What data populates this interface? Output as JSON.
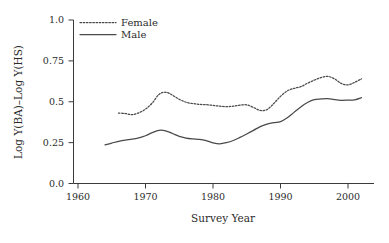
{
  "chart_data": {
    "type": "line",
    "title": "",
    "subtitle": "",
    "xlabel": "Survey Year",
    "ylabel": "Log Y(BA)–Log Y(HS)",
    "xlim": [
      1958,
      2004
    ],
    "ylim": [
      0.0,
      1.0
    ],
    "grid": false,
    "legend_position": "top-left",
    "xticks": [
      1960,
      1970,
      1980,
      1990,
      2000
    ],
    "xtick_labels": [
      "1960",
      "1970",
      "1980",
      "1990",
      "2000"
    ],
    "yticks": [
      0.0,
      0.25,
      0.5,
      0.75,
      1.0
    ],
    "ytick_labels": [
      "0.0",
      "0.25",
      "0.5",
      "0.75",
      "1.0"
    ],
    "series": [
      {
        "name": "Female",
        "style": "dotted",
        "color": "#4a4a4a",
        "x": [
          1966,
          1967,
          1968,
          1969,
          1970,
          1971,
          1972,
          1973,
          1974,
          1975,
          1976,
          1977,
          1978,
          1979,
          1980,
          1981,
          1982,
          1983,
          1984,
          1985,
          1986,
          1987,
          1988,
          1989,
          1990,
          1991,
          1992,
          1993,
          1994,
          1995,
          1996,
          1997,
          1998,
          1999,
          2000,
          2001,
          2002
        ],
        "y": [
          0.431,
          0.428,
          0.421,
          0.432,
          0.455,
          0.492,
          0.545,
          0.558,
          0.54,
          0.515,
          0.497,
          0.489,
          0.484,
          0.482,
          0.478,
          0.473,
          0.47,
          0.473,
          0.479,
          0.481,
          0.465,
          0.447,
          0.452,
          0.489,
          0.533,
          0.566,
          0.582,
          0.592,
          0.613,
          0.632,
          0.648,
          0.655,
          0.64,
          0.612,
          0.603,
          0.619,
          0.64
        ]
      },
      {
        "name": "Male",
        "style": "solid",
        "color": "#4a4a4a",
        "x": [
          1964,
          1965,
          1966,
          1967,
          1968,
          1969,
          1970,
          1971,
          1972,
          1973,
          1974,
          1975,
          1976,
          1977,
          1978,
          1979,
          1980,
          1981,
          1982,
          1983,
          1984,
          1985,
          1986,
          1987,
          1988,
          1989,
          1990,
          1991,
          1992,
          1993,
          1994,
          1995,
          1996,
          1997,
          1998,
          1999,
          2000,
          2001,
          2002
        ],
        "y": [
          0.236,
          0.247,
          0.258,
          0.266,
          0.271,
          0.279,
          0.292,
          0.311,
          0.325,
          0.322,
          0.306,
          0.288,
          0.278,
          0.273,
          0.27,
          0.262,
          0.249,
          0.243,
          0.25,
          0.263,
          0.282,
          0.303,
          0.325,
          0.348,
          0.363,
          0.372,
          0.378,
          0.402,
          0.435,
          0.468,
          0.495,
          0.513,
          0.517,
          0.519,
          0.513,
          0.509,
          0.51,
          0.512,
          0.525
        ]
      }
    ],
    "annotations": []
  },
  "legend": {
    "items": [
      {
        "label": "Female",
        "style": "dotted"
      },
      {
        "label": "Male",
        "style": "solid"
      }
    ]
  },
  "axes": {
    "x_title": "Survey Year",
    "y_title": "Log Y(BA)–Log Y(HS)"
  },
  "colors": {
    "line": "#4a4a4a",
    "axis": "#3a3a3a",
    "text": "#2b2b2b",
    "background": "#ffffff"
  }
}
